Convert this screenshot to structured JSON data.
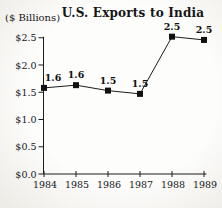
{
  "chart_data": {
    "type": "line",
    "title": "U.S. Exports to India",
    "ylabel": "($ Billions)",
    "xlabel": "",
    "categories": [
      "1984",
      "1985",
      "1986",
      "1987",
      "1988",
      "1989"
    ],
    "values": [
      1.6,
      1.6,
      1.5,
      1.5,
      2.5,
      2.5
    ],
    "point_labels": [
      "1.6",
      "1.6",
      "1.5",
      "1.5",
      "2.5",
      "2.5"
    ],
    "plot_values": [
      1.58,
      1.63,
      1.53,
      1.47,
      2.52,
      2.46
    ],
    "y_ticks": [
      "$0.0",
      "$0.5",
      "$1.0",
      "$1.5",
      "$2.0",
      "$2.5"
    ],
    "ylim": [
      0,
      2.5
    ],
    "grid": false,
    "legend": "none",
    "marker_shape": "square",
    "line_color": "#1c1c1c",
    "ink_color": "#161616",
    "background_color": "#f6f5f1"
  }
}
